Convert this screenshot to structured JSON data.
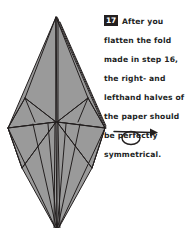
{
  "page": {
    "background_color": "#ffffff",
    "ink_color": "#231f1f"
  },
  "instruction": {
    "step_number": "17",
    "text": "After you flatten the fold made in step 16, the right- and lefthand halves of the paper should be perfectly symmetrical.",
    "badge_background": "#231f1f",
    "badge_text_color": "#ffffff"
  },
  "figure": {
    "title": "origami-folded-model",
    "fill_color": "#9a9a9a",
    "fill_color_dark": "#8b8b8b",
    "line_color": "#231f1f",
    "apex": {
      "x": 56,
      "y": 17
    },
    "left_point": {
      "x": 8,
      "y": 128
    },
    "right_point": {
      "x": 105,
      "y": 128
    },
    "center_node": {
      "x": 56,
      "y": 122
    },
    "bottom_point": {
      "x": 57,
      "y": 231
    }
  },
  "symbol": {
    "name": "turn-over-arrow",
    "label": "turn the model over",
    "line_color": "#231f1f"
  }
}
